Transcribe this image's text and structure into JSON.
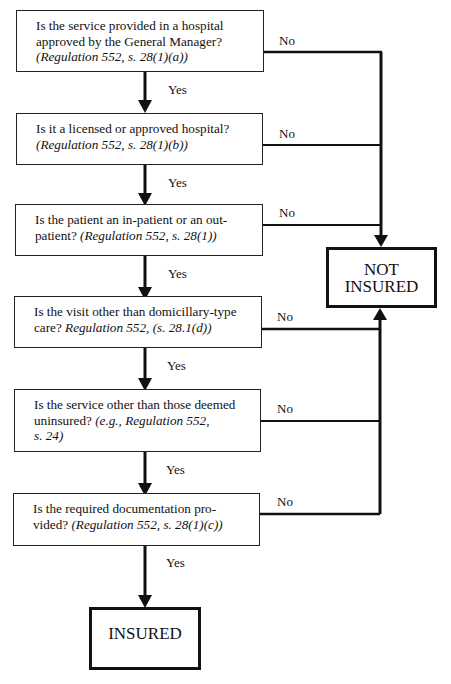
{
  "questions": [
    {
      "text": "Is the service provided in a hospital approved by the General Manager?",
      "ref": "(Regulation 552, s. 28(1)(a))"
    },
    {
      "text": "Is it a licensed or approved hospital?",
      "ref": "(Regulation 552, s. 28(1)(b))"
    },
    {
      "text": "Is the patient an in-patient or an out-patient?",
      "ref": "(Regulation 552, s. 28(1))"
    },
    {
      "text": "Is the visit other than domicillary-type care?",
      "ref": "Regulation 552, (s. 28.1(d))"
    },
    {
      "text": "Is the service other than those deemed uninsured?",
      "ref": "(e.g., Regulation 552, s. 24)"
    },
    {
      "text": "Is the required documentation provided?",
      "ref": "(Regulation 552, s. 28(1)(c))"
    }
  ],
  "labels": {
    "yes": "Yes",
    "no": "No"
  },
  "outcomes": {
    "not_insured_line1": "NOT",
    "not_insured_line2": "INSURED",
    "insured": "INSURED"
  },
  "lines_html": {
    "q0a": "Is the service provided in a hospital",
    "q0b": "approved by the General Manager?",
    "q1a": "Is it a licensed or approved hospital?",
    "q2a": "Is the patient an in-patient or an out-",
    "q2b": "patient?",
    "q3a": "Is the visit other than domicillary-type",
    "q3b": "care?",
    "q4a": "Is the service other than those deemed",
    "q4b": "uninsured?",
    "q4c": "s. 24)",
    "q4ref": "(e.g., Regulation 552,",
    "q5a": "Is the required documentation pro-",
    "q5b": "vided?"
  }
}
